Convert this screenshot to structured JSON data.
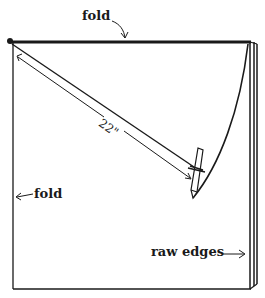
{
  "diagram": {
    "labels": {
      "top_fold": "fold",
      "left_fold": "fold",
      "measurement": "22\"",
      "raw_edges": "raw edges"
    },
    "colors": {
      "ink": "#1a1a1a",
      "background": "#ffffff"
    }
  }
}
